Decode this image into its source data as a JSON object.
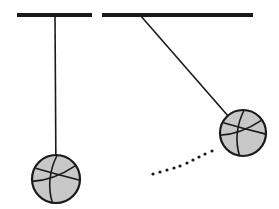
{
  "diagram": {
    "colors": {
      "stroke": "#1a1a1a",
      "ball_fill": "#c8c8c8",
      "background": "#ffffff"
    },
    "supports": [
      {
        "x1": 17,
        "y1": 15,
        "x2": 92,
        "y2": 15
      },
      {
        "x1": 102,
        "y1": 15,
        "x2": 253,
        "y2": 15
      }
    ],
    "pendulums": [
      {
        "name": "rest",
        "pivot": [
          55,
          15
        ],
        "bob": [
          56,
          179
        ],
        "radius": 24
      },
      {
        "name": "displaced",
        "pivot": [
          140,
          15
        ],
        "bob": [
          243,
          133
        ],
        "radius": 23
      }
    ],
    "path_dots": [
      [
        153,
        174
      ],
      [
        160,
        172
      ],
      [
        167,
        170
      ],
      [
        174,
        168
      ],
      [
        180,
        166
      ],
      [
        187,
        163
      ],
      [
        193,
        160
      ],
      [
        199,
        157
      ],
      [
        205,
        154
      ],
      [
        212,
        151
      ]
    ]
  }
}
